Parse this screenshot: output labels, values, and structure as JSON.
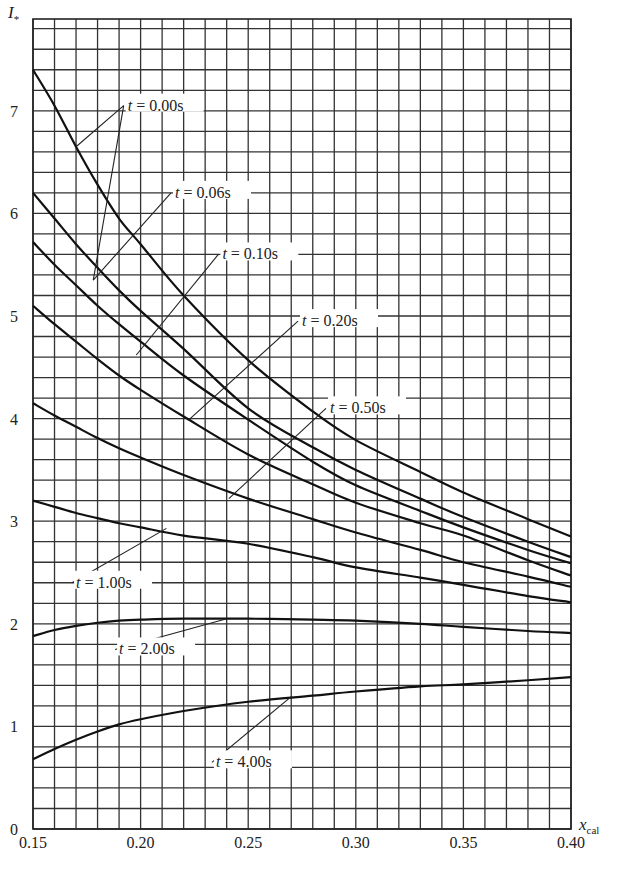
{
  "chart_data": {
    "type": "line",
    "title": "",
    "xlabel": "x_cal",
    "ylabel": "I_*",
    "xlim": [
      0.15,
      0.4
    ],
    "ylim": [
      0,
      7.8
    ],
    "grid": true,
    "legend_position": "inline labels with leader lines",
    "x_ticks": [
      "0.15",
      "0.20",
      "0.25",
      "0.30",
      "0.35",
      "0.40"
    ],
    "y_ticks": [
      "0",
      "1",
      "2",
      "3",
      "4",
      "5",
      "6",
      "7"
    ],
    "x": [
      0.15,
      0.16,
      0.17,
      0.18,
      0.19,
      0.2,
      0.22,
      0.25,
      0.28,
      0.3,
      0.33,
      0.35,
      0.38,
      0.4
    ],
    "series": [
      {
        "name": "t = 0.00s",
        "values": [
          7.4,
          7.05,
          6.65,
          6.28,
          5.95,
          5.7,
          5.2,
          4.57,
          4.07,
          3.79,
          3.48,
          3.28,
          3.02,
          2.85
        ]
      },
      {
        "name": "t = 0.06s",
        "values": [
          6.2,
          5.95,
          5.7,
          5.47,
          5.25,
          5.05,
          4.68,
          4.1,
          3.72,
          3.5,
          3.22,
          3.04,
          2.8,
          2.65
        ]
      },
      {
        "name": "t = 0.10s",
        "values": [
          5.72,
          5.5,
          5.3,
          5.1,
          4.92,
          4.75,
          4.42,
          3.99,
          3.58,
          3.35,
          3.1,
          2.94,
          2.72,
          2.59
        ]
      },
      {
        "name": "t = 0.20s",
        "values": [
          5.1,
          4.92,
          4.75,
          4.58,
          4.42,
          4.28,
          4.02,
          3.65,
          3.36,
          3.18,
          2.98,
          2.86,
          2.62,
          2.47
        ]
      },
      {
        "name": "t = 0.50s",
        "values": [
          4.15,
          4.03,
          3.92,
          3.81,
          3.71,
          3.62,
          3.45,
          3.22,
          3.02,
          2.89,
          2.72,
          2.6,
          2.46,
          2.36
        ]
      },
      {
        "name": "t = 1.00s",
        "values": [
          3.2,
          3.14,
          3.08,
          3.03,
          2.98,
          2.94,
          2.86,
          2.78,
          2.65,
          2.55,
          2.45,
          2.38,
          2.27,
          2.21
        ]
      },
      {
        "name": "t = 2.00s",
        "values": [
          1.88,
          1.94,
          1.98,
          2.01,
          2.03,
          2.04,
          2.05,
          2.05,
          2.04,
          2.03,
          2.0,
          1.97,
          1.93,
          1.91
        ]
      },
      {
        "name": "t = 4.00s",
        "values": [
          0.68,
          0.78,
          0.87,
          0.95,
          1.02,
          1.07,
          1.15,
          1.24,
          1.3,
          1.34,
          1.39,
          1.41,
          1.45,
          1.48
        ]
      }
    ],
    "annotations": [
      {
        "text": "t = 0.00s",
        "label_x": 0.194,
        "label_y": 7.05,
        "points": [
          [
            0.17,
            6.65
          ],
          [
            0.178,
            5.35
          ]
        ]
      },
      {
        "text": "t = 0.06s",
        "label_x": 0.216,
        "label_y": 6.2,
        "points": [
          [
            0.178,
            5.35
          ]
        ]
      },
      {
        "text": "t = 0.10s",
        "label_x": 0.238,
        "label_y": 5.6,
        "points": [
          [
            0.198,
            4.62
          ]
        ]
      },
      {
        "text": "t = 0.20s",
        "label_x": 0.275,
        "label_y": 4.95,
        "points": [
          [
            0.222,
            3.98
          ]
        ]
      },
      {
        "text": "t = 0.50s",
        "label_x": 0.288,
        "label_y": 4.1,
        "points": [
          [
            0.241,
            3.22
          ]
        ]
      },
      {
        "text": "t = 1.00s",
        "label_x": 0.17,
        "label_y": 2.4,
        "points": [
          [
            0.212,
            2.93
          ]
        ]
      },
      {
        "text": "t = 2.00s",
        "label_x": 0.19,
        "label_y": 1.75,
        "points": [
          [
            0.24,
            2.05
          ]
        ]
      },
      {
        "text": "t = 4.00s",
        "label_x": 0.235,
        "label_y": 0.65,
        "points": [
          [
            0.27,
            1.29
          ]
        ]
      }
    ]
  },
  "axes": {
    "y_symbol": "I",
    "y_subscript": "*",
    "x_symbol": "x",
    "x_subscript": "cal"
  }
}
